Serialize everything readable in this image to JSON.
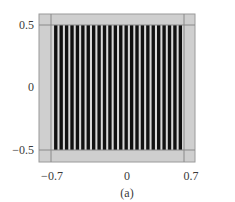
{
  "chart_data": {
    "type": "heatmap",
    "title": "",
    "caption": "(a)",
    "xlabel": "",
    "ylabel": "",
    "xlim": [
      -0.7,
      0.7
    ],
    "ylim": [
      -0.5,
      0.5
    ],
    "x_ticks": [
      -0.7,
      0,
      0.7
    ],
    "x_tick_labels": [
      "−0.7",
      "0",
      "0.7"
    ],
    "y_ticks": [
      0.5,
      0,
      -0.5
    ],
    "y_tick_labels": [
      "0.5",
      "0",
      "−0.5"
    ],
    "grid": false,
    "legend": null,
    "stripes": {
      "orientation": "vertical",
      "count": 24,
      "duty_dark": 0.62,
      "x_start": -0.6,
      "x_end": 0.6,
      "y_start": -0.5,
      "y_end": 0.5
    },
    "colors": {
      "stripe_dark": "#111111",
      "stripe_light": "#d8d8d8",
      "margin": "#cfcfcf",
      "frame": "#8a8a8a"
    }
  },
  "labels": {
    "x_left": "−0.7",
    "x_mid": "0",
    "x_right": "0.7",
    "y_top": "0.5",
    "y_mid": "0",
    "y_bottom": "−0.5",
    "caption": "(a)"
  }
}
